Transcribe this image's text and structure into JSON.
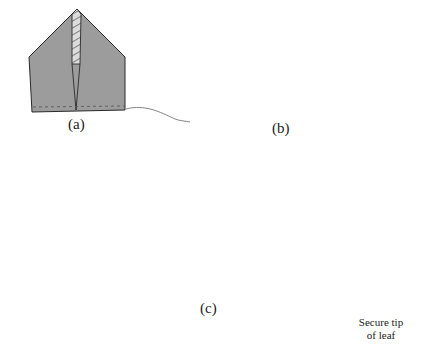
{
  "figure": {
    "panels": [
      {
        "id": "a",
        "caption": "(a)",
        "description": "Folded square of fabric with pointed top, hatched inner section and stitched bottom edge with thread tail"
      },
      {
        "id": "b",
        "caption": "(b)",
        "description": "Fabric gathered into a leaf/petal shape with hatched inner fold and thread tail"
      },
      {
        "id": "c",
        "caption": "(c)",
        "description": "Finished fabric rose with two leaves on either side"
      }
    ],
    "annotation": {
      "line1": "Secure tip",
      "line2": "of leaf"
    },
    "colors": {
      "fabric_light": "#9c9c9c",
      "rose_dark": "#7a7a7a",
      "leaf": "#9e9e9e",
      "outline": "#2a2a2a",
      "hatch_bg": "#d8d8d8",
      "thread": "#555555"
    }
  }
}
